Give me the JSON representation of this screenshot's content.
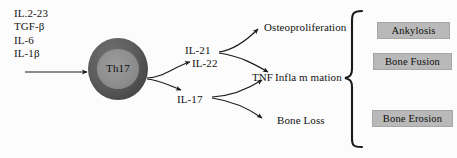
{
  "figure": {
    "background_color": "#fcfcfc",
    "box_fill_color": "#b9b9b9",
    "cell_outer_color": "#4a4a4a",
    "cell_inner_color": "#8e8e8e",
    "stroke_color": "#1a1a1a"
  },
  "inducers": {
    "label": "Th17 inducing cytokines",
    "items": [
      {
        "text": "IL.2-23"
      },
      {
        "text": "TGF-β"
      },
      {
        "text": "IL-6"
      },
      {
        "text": "IL-1β"
      }
    ]
  },
  "cell": {
    "label": "Th17"
  },
  "mediators": [
    {
      "key": "il21",
      "text": "IL-21"
    },
    {
      "key": "il22",
      "text": "IL-22"
    },
    {
      "key": "il17",
      "text": "IL-17"
    },
    {
      "key": "tnf",
      "text": "TNF"
    }
  ],
  "effects": [
    {
      "key": "osteoproliferation",
      "text": "Osteoproliferation"
    },
    {
      "key": "inflammation",
      "text": "Infla m mation"
    },
    {
      "key": "bone_loss",
      "text": "Bone Loss"
    }
  ],
  "outcomes": [
    {
      "key": "ankylosis",
      "text": "Ankylosis"
    },
    {
      "key": "bone_fusion",
      "text": "Bone Fusion"
    },
    {
      "key": "bone_erosion",
      "text": "Bone Erosion"
    }
  ]
}
